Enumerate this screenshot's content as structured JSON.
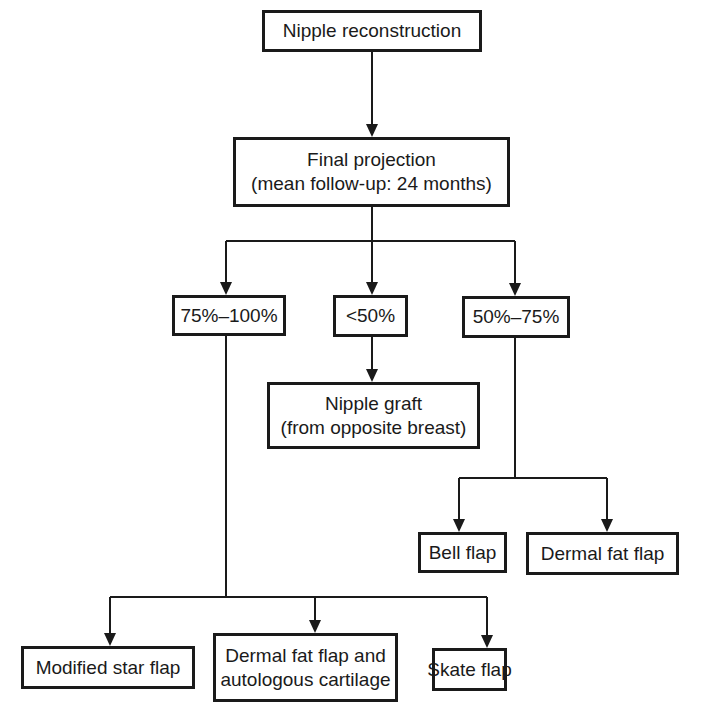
{
  "diagram": {
    "type": "flowchart",
    "root": {
      "label": "Nipple reconstruction"
    },
    "assessment": {
      "line1": "Final projection",
      "line2": "(mean follow-up: 24 months)"
    },
    "branches": [
      {
        "label": "75%–100%",
        "children": [
          "Modified star flap",
          "Dermal fat flap and autologous cartilage",
          "Skate flap"
        ]
      },
      {
        "label": "<50%",
        "children": [
          "Nipple graft (from opposite breast)"
        ]
      },
      {
        "label": "50%–75%",
        "children": [
          "Bell flap",
          "Dermal fat flap"
        ]
      }
    ],
    "nodes": {
      "high": "75%–100%",
      "low": "<50%",
      "mid": "50%–75%",
      "graft_line1": "Nipple graft",
      "graft_line2": "(from opposite breast)",
      "bell": "Bell flap",
      "dermal": "Dermal fat flap",
      "star": "Modified star flap",
      "dermal_cart_line1": "Dermal fat flap and",
      "dermal_cart_line2": "autologous cartilage",
      "skate": "Skate flap"
    },
    "colors": {
      "stroke": "#1a1a1a",
      "background": "#ffffff"
    }
  }
}
